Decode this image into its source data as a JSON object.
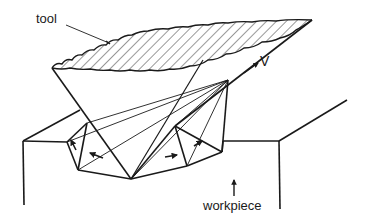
{
  "figure": {
    "type": "line-drawing",
    "colors": {
      "stroke": "#1a1a1a",
      "background": "#ffffff",
      "hatch": "#333333"
    }
  },
  "labels": {
    "tool": "tool",
    "velocity": "V",
    "workpiece": "workpiece"
  },
  "annotations": [
    {
      "name": "tool-leader-line",
      "points_to": "tool"
    },
    {
      "name": "velocity-arrow",
      "label": "V"
    },
    {
      "name": "workpiece-arrow",
      "label": "workpiece",
      "direction": "up"
    },
    {
      "name": "flow-arrow-left-1",
      "direction": "up-left"
    },
    {
      "name": "flow-arrow-left-2",
      "direction": "left"
    },
    {
      "name": "flow-arrow-right-1",
      "direction": "right"
    },
    {
      "name": "flow-arrow-right-2",
      "direction": "up-right"
    }
  ]
}
